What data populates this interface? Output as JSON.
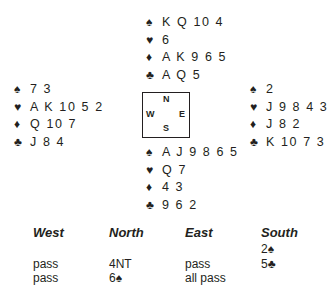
{
  "hands": {
    "north": {
      "spades": "K Q 10 4",
      "hearts": "6",
      "diamonds": "A K 9 6 5",
      "clubs": "A Q 5"
    },
    "west": {
      "spades": "7 3",
      "hearts": "A K 10 5 2",
      "diamonds": "Q 10 7",
      "clubs": "J 8 4"
    },
    "east": {
      "spades": "2",
      "hearts": "J 9 8 4 3",
      "diamonds": "J 8 2",
      "clubs": "K 10 7 3"
    },
    "south": {
      "spades": "A J 9 8 6 5",
      "hearts": "Q 7",
      "diamonds": "4 3",
      "clubs": "9 6 2"
    }
  },
  "suit_symbols": {
    "spades": "♠",
    "hearts": "♥",
    "diamonds": "♦",
    "clubs": "♣"
  },
  "compass": {
    "n": "N",
    "w": "W",
    "e": "E",
    "s": "S"
  },
  "auction": {
    "headers": [
      "West",
      "North",
      "East",
      "South"
    ],
    "rows": [
      [
        "",
        "",
        "",
        "2♠"
      ],
      [
        "pass",
        "4NT",
        "pass",
        "5♣"
      ],
      [
        "pass",
        "6♠",
        "all pass",
        ""
      ]
    ]
  }
}
